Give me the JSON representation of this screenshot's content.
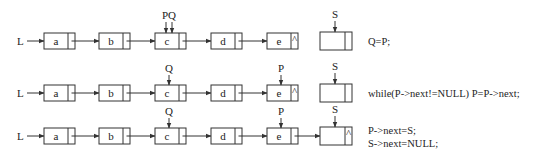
{
  "rows": [
    {
      "head_label": "L",
      "nodes": [
        "a",
        "b",
        "c",
        "d",
        "e"
      ],
      "last_node_null": true,
      "pointers": [
        {
          "label": "PQ",
          "node": 2
        }
      ],
      "s_label": "S",
      "s_linked": false,
      "s_null": false,
      "code": [
        "Q=P;"
      ]
    },
    {
      "head_label": "L",
      "nodes": [
        "a",
        "b",
        "c",
        "d",
        "e"
      ],
      "last_node_null": true,
      "pointers": [
        {
          "label": "Q",
          "node": 2
        },
        {
          "label": "P",
          "node": 4
        }
      ],
      "s_label": "S",
      "s_linked": false,
      "s_null": false,
      "code": [
        "while(P->next!=NULL) P=P->next;"
      ]
    },
    {
      "head_label": "L",
      "nodes": [
        "a",
        "b",
        "c",
        "d",
        "e"
      ],
      "last_node_null": false,
      "pointers": [
        {
          "label": "Q",
          "node": 2
        },
        {
          "label": "P",
          "node": 4
        }
      ],
      "s_label": "S",
      "s_linked": true,
      "s_null": true,
      "code": [
        "P->next=S;",
        "S->next=NULL;"
      ]
    }
  ],
  "null_symbol": "^"
}
